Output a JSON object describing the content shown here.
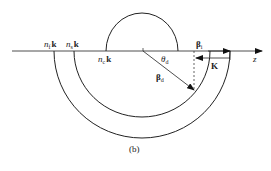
{
  "diagram": {
    "caption": "(b)",
    "axis": {
      "label": "z"
    },
    "circles": [
      {
        "id": "nc",
        "n": "n",
        "sub": "c",
        "k": "k",
        "label": "n_c k"
      },
      {
        "id": "ns",
        "n": "n",
        "sub": "s",
        "k": "k",
        "label": "n_s k"
      },
      {
        "id": "nf",
        "n": "n",
        "sub": "f",
        "k": "k",
        "label": "n_f k"
      }
    ],
    "vectors": {
      "beta_d": {
        "sym": "β",
        "sub": "d"
      },
      "beta_i": {
        "sym": "β",
        "sub": "i"
      },
      "K": {
        "sym": "K"
      }
    },
    "angle": {
      "sym": "θ",
      "sub": "d"
    }
  }
}
